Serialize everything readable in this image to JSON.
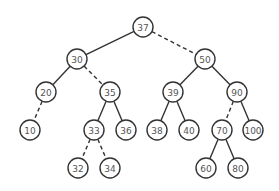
{
  "diagram": {
    "type": "binary-tree",
    "radius": 10,
    "nodes": [
      {
        "id": "n37",
        "label": "37",
        "x": 143,
        "y": 27
      },
      {
        "id": "n30",
        "label": "30",
        "x": 77,
        "y": 59
      },
      {
        "id": "n50",
        "label": "50",
        "x": 205,
        "y": 59
      },
      {
        "id": "n20",
        "label": "20",
        "x": 46,
        "y": 92
      },
      {
        "id": "n35",
        "label": "35",
        "x": 110,
        "y": 92
      },
      {
        "id": "n39",
        "label": "39",
        "x": 173,
        "y": 92
      },
      {
        "id": "n90",
        "label": "90",
        "x": 237,
        "y": 92
      },
      {
        "id": "n10",
        "label": "10",
        "x": 30,
        "y": 130
      },
      {
        "id": "n33",
        "label": "33",
        "x": 94,
        "y": 130
      },
      {
        "id": "n36",
        "label": "36",
        "x": 126,
        "y": 130
      },
      {
        "id": "n38",
        "label": "38",
        "x": 157,
        "y": 130
      },
      {
        "id": "n40",
        "label": "40",
        "x": 189,
        "y": 130
      },
      {
        "id": "n70",
        "label": "70",
        "x": 222,
        "y": 130
      },
      {
        "id": "n100",
        "label": "100",
        "x": 253,
        "y": 130
      },
      {
        "id": "n32",
        "label": "32",
        "x": 78,
        "y": 168
      },
      {
        "id": "n34",
        "label": "34",
        "x": 110,
        "y": 168
      },
      {
        "id": "n60",
        "label": "60",
        "x": 206,
        "y": 168
      },
      {
        "id": "n80",
        "label": "80",
        "x": 238,
        "y": 168
      }
    ],
    "edges": [
      {
        "from": "n37",
        "to": "n30",
        "style": "solid"
      },
      {
        "from": "n37",
        "to": "n50",
        "style": "dashed"
      },
      {
        "from": "n30",
        "to": "n20",
        "style": "solid"
      },
      {
        "from": "n30",
        "to": "n35",
        "style": "dashed"
      },
      {
        "from": "n50",
        "to": "n39",
        "style": "solid"
      },
      {
        "from": "n50",
        "to": "n90",
        "style": "solid"
      },
      {
        "from": "n20",
        "to": "n10",
        "style": "dashed"
      },
      {
        "from": "n35",
        "to": "n33",
        "style": "solid"
      },
      {
        "from": "n35",
        "to": "n36",
        "style": "solid"
      },
      {
        "from": "n39",
        "to": "n38",
        "style": "solid"
      },
      {
        "from": "n39",
        "to": "n40",
        "style": "solid"
      },
      {
        "from": "n90",
        "to": "n70",
        "style": "dashed"
      },
      {
        "from": "n90",
        "to": "n100",
        "style": "solid"
      },
      {
        "from": "n33",
        "to": "n32",
        "style": "dashed"
      },
      {
        "from": "n33",
        "to": "n34",
        "style": "dashed"
      },
      {
        "from": "n70",
        "to": "n60",
        "style": "solid"
      },
      {
        "from": "n70",
        "to": "n80",
        "style": "solid"
      }
    ]
  }
}
